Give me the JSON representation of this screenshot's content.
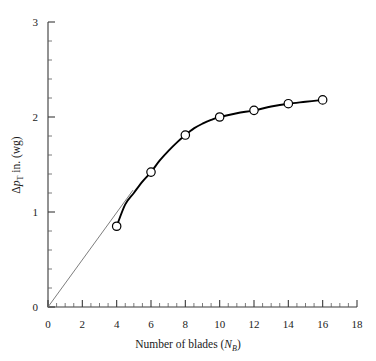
{
  "chart_data": {
    "type": "line",
    "title": "",
    "xlabel": "Number of blades (N_B)",
    "ylabel": "Δp_T in. (wg)",
    "xlabel_main": "Number of blades (",
    "xlabel_var": "N",
    "xlabel_sub": "B",
    "xlabel_close": ")",
    "ylabel_delta": "Δ",
    "ylabel_var": "p",
    "ylabel_sub": "T",
    "ylabel_rest": " in. (wg)",
    "xlim": [
      0,
      18
    ],
    "ylim": [
      0,
      3
    ],
    "xticks": [
      0,
      2,
      4,
      6,
      8,
      10,
      12,
      14,
      16,
      18
    ],
    "xtick_labels": [
      "0",
      "2",
      "4",
      "6",
      "8",
      "10",
      "12",
      "14",
      "16",
      "18"
    ],
    "yticks": [
      0,
      1,
      2,
      3
    ],
    "ytick_labels": [
      "0",
      "1",
      "2",
      "3"
    ],
    "x_minor_step": 0.5,
    "y_minor_step": 0.2,
    "grid": false,
    "legend": "none",
    "marker": "open-circle",
    "x": [
      4,
      6,
      8,
      10,
      12,
      14,
      16
    ],
    "values": [
      0.85,
      1.42,
      1.81,
      2.0,
      2.07,
      2.14,
      2.18
    ],
    "series": [
      {
        "name": "Total pressure rise vs number of blades",
        "x": [
          4,
          6,
          8,
          10,
          12,
          14,
          16
        ],
        "values": [
          0.85,
          1.42,
          1.81,
          2.0,
          2.07,
          2.14,
          2.18
        ]
      }
    ],
    "curve_points": [
      [
        4,
        0.85
      ],
      [
        4.5,
        1.08
      ],
      [
        5,
        1.2
      ],
      [
        5.5,
        1.32
      ],
      [
        6,
        1.42
      ],
      [
        6.5,
        1.54
      ],
      [
        7,
        1.64
      ],
      [
        7.5,
        1.73
      ],
      [
        8,
        1.81
      ],
      [
        8.5,
        1.88
      ],
      [
        9,
        1.93
      ],
      [
        9.5,
        1.97
      ],
      [
        10,
        2.0
      ],
      [
        11,
        2.04
      ],
      [
        12,
        2.07
      ],
      [
        13,
        2.11
      ],
      [
        14,
        2.14
      ],
      [
        15,
        2.16
      ],
      [
        16,
        2.18
      ]
    ],
    "tangent_line": {
      "name": "origin tangent",
      "from": [
        0,
        0
      ],
      "to": [
        4.95,
        1.23
      ]
    },
    "annotations": []
  }
}
